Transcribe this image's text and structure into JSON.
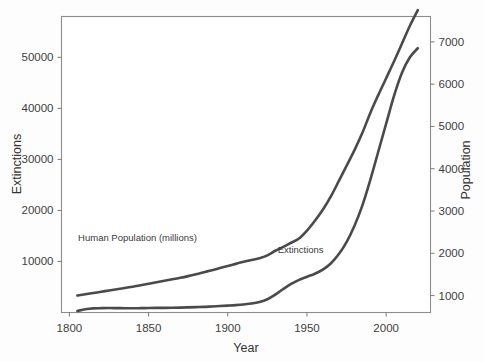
{
  "figure": {
    "background_color": "#fdfdfd",
    "plot_background_color": "#ffffff",
    "frame_color": "#8d8d8d",
    "line_color": "#4a4a4a"
  },
  "chart_data": {
    "type": "line",
    "title": "",
    "subtitle": "",
    "xlabel": "Year",
    "ylabel": "Extinctions",
    "y2label": "Population",
    "xlim": [
      1795,
      2028
    ],
    "ylim": [
      0,
      58000
    ],
    "y2lim": [
      600,
      7600
    ],
    "grid": false,
    "legend_position": "inline-annotations",
    "xticks": [
      1800,
      1850,
      1900,
      1950,
      2000
    ],
    "xticklabels": [
      "1800",
      "1850",
      "1900",
      "1950",
      "2000"
    ],
    "yticks": [
      10000,
      20000,
      30000,
      40000,
      50000
    ],
    "yticklabels": [
      "10000",
      "20000",
      "30000",
      "40000",
      "50000"
    ],
    "y2ticks": [
      1000,
      2000,
      3000,
      4000,
      5000,
      6000,
      7000
    ],
    "y2ticklabels": [
      "1000",
      "2000",
      "3000",
      "4000",
      "5000",
      "6000",
      "7000"
    ],
    "annotations": [
      {
        "text": "Human Population (millions)",
        "x": 1843,
        "y_axis": "right",
        "y": 2280
      },
      {
        "text": "Extinctions",
        "x": 1946,
        "y_axis": "left",
        "y": 11600
      }
    ],
    "series": [
      {
        "name": "Human Population (millions)",
        "axis": "right",
        "x": [
          1805,
          1810,
          1815,
          1820,
          1825,
          1830,
          1835,
          1840,
          1845,
          1850,
          1855,
          1860,
          1865,
          1870,
          1875,
          1880,
          1885,
          1890,
          1895,
          1900,
          1905,
          1910,
          1915,
          1920,
          1925,
          1930,
          1935,
          1940,
          1945,
          1950,
          1955,
          1960,
          1965,
          1970,
          1975,
          1980,
          1985,
          1990,
          1995,
          2000,
          2005,
          2010,
          2015,
          2020
        ],
        "y": [
          1000,
          1030,
          1060,
          1090,
          1120,
          1150,
          1180,
          1210,
          1245,
          1280,
          1315,
          1350,
          1385,
          1420,
          1460,
          1505,
          1550,
          1600,
          1650,
          1700,
          1750,
          1800,
          1840,
          1880,
          1950,
          2060,
          2150,
          2250,
          2350,
          2536,
          2770,
          3030,
          3340,
          3700,
          4070,
          4440,
          4850,
          5320,
          5740,
          6140,
          6540,
          6960,
          7380,
          7750
        ],
        "units": "millions"
      },
      {
        "name": "Extinctions",
        "axis": "left",
        "x": [
          1805,
          1810,
          1815,
          1820,
          1825,
          1830,
          1835,
          1840,
          1845,
          1850,
          1855,
          1860,
          1865,
          1870,
          1875,
          1880,
          1885,
          1890,
          1895,
          1900,
          1905,
          1910,
          1915,
          1920,
          1925,
          1930,
          1935,
          1940,
          1945,
          1950,
          1955,
          1960,
          1965,
          1970,
          1975,
          1980,
          1985,
          1990,
          1995,
          2000,
          2005,
          2010,
          2015,
          2020
        ],
        "y": [
          300,
          620,
          800,
          850,
          870,
          860,
          840,
          830,
          850,
          880,
          900,
          910,
          930,
          960,
          1000,
          1050,
          1100,
          1180,
          1260,
          1350,
          1450,
          1580,
          1750,
          2050,
          2600,
          3500,
          4600,
          5600,
          6400,
          7000,
          7600,
          8400,
          9600,
          11400,
          13800,
          17000,
          21000,
          26000,
          31500,
          37000,
          42500,
          47000,
          50000,
          51800
        ],
        "units": "count"
      }
    ]
  }
}
